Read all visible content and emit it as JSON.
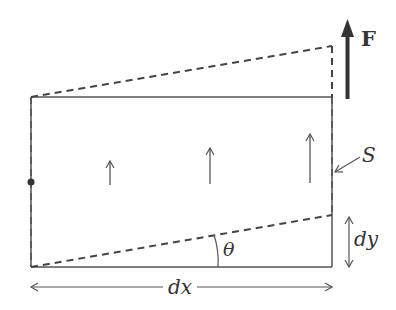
{
  "diagram": {
    "type": "shear deformation of a fluid/solid element",
    "labels": {
      "force": "F",
      "surface": "S",
      "angle": "θ",
      "dy": "dy",
      "dx": "dx"
    },
    "colors": {
      "line": "#555555",
      "force_arrow": "#333333",
      "text": "#333333",
      "background": "#ffffff"
    },
    "elements": {
      "original_rectangle": "solid outline",
      "deformed_top_edge": "dashed, sloped upward to the right",
      "deformed_bottom_edge": "dashed, sloped upward at angle θ",
      "interior_arrows": 3,
      "pivot_dot": "left edge midpoint"
    }
  }
}
